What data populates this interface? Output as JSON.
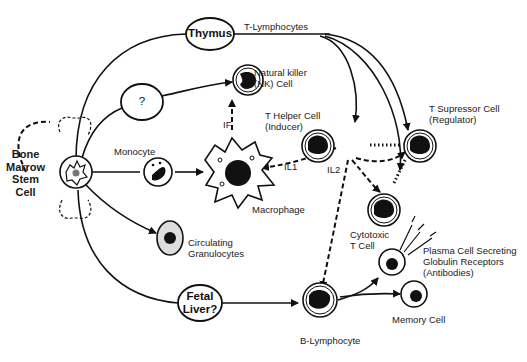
{
  "diagram": {
    "colors": {
      "ink": "#111111",
      "background": "#ffffff"
    },
    "nodes": {
      "stem_cell": {
        "line1": "Bone",
        "line2": "Marrow",
        "line3": "Stem",
        "line4": "Cell"
      },
      "thymus": "Thymus",
      "unknown_organ": "?",
      "fetal_liver": {
        "line1": "Fetal",
        "line2": "Liver?"
      },
      "t_lymphocytes": "T-Lymphocytes",
      "nk_cell": {
        "line1": "Natural killer",
        "line2": "(NK) Cell"
      },
      "monocyte": "Monocyte",
      "macrophage": "Macrophage",
      "granulocytes": {
        "line1": "Circulating",
        "line2": "Granulocytes"
      },
      "t_helper": {
        "line1": "T Helper Cell",
        "line2": "(Inducer)"
      },
      "t_suppressor": {
        "line1": "T Supressor Cell",
        "line2": "(Regulator)"
      },
      "cytotoxic": {
        "line1": "Cytotoxic",
        "line2": "T Cell"
      },
      "plasma_cell": {
        "line1": "Plasma Cell Secreting",
        "line2": "Globulin Receptors",
        "line3": "(Antibodies)"
      },
      "memory_cell": "Memory Cell",
      "b_lymphocyte": "B-Lymphocyte"
    },
    "edge_labels": {
      "if": "IF",
      "il1": "IL1",
      "il2": "IL2"
    }
  }
}
